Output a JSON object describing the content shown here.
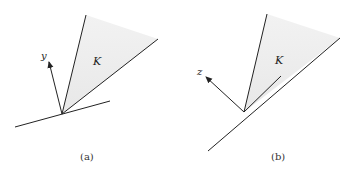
{
  "panels": [
    {
      "id": "a",
      "caption": "(a)",
      "cone_label": "K",
      "vector_label": "y",
      "apex": [
        62,
        114
      ],
      "cone_left_ray_end": [
        86,
        15
      ],
      "cone_right_ray_end": [
        158,
        39
      ],
      "vector_end": [
        49,
        60
      ],
      "line_start": [
        15,
        127
      ],
      "line_end": [
        110,
        101
      ]
    },
    {
      "id": "b",
      "caption": "(b)",
      "cone_label": "K",
      "vector_label": "z",
      "apex": [
        244,
        112
      ],
      "cone_left_ray_end": [
        267,
        14
      ],
      "cone_right_ray_end": [
        340,
        38
      ],
      "inner_line_end": [
        281,
        76
      ],
      "vector_end": [
        205,
        76
      ],
      "line_start": [
        208,
        151
      ],
      "line_end": [
        244,
        112
      ]
    }
  ],
  "colors": {
    "stroke": "#222222",
    "cone_fill": "#ececec"
  }
}
